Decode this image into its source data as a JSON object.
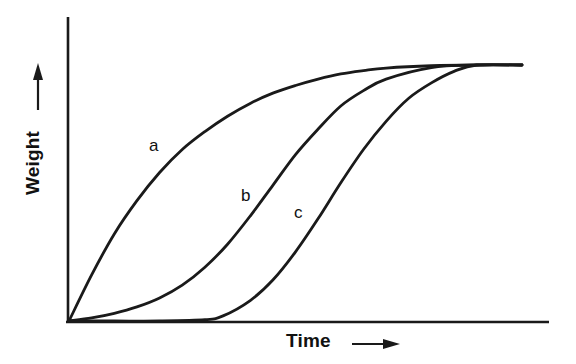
{
  "figure": {
    "background_color": "#ffffff",
    "line_color": "#1a1a1a",
    "axes": {
      "x_axis_label": "Time",
      "x_axis_arrow": "right-arrow-icon",
      "y_axis_label": "Weight",
      "y_axis_arrow": "up-arrow-icon",
      "x_tick_labels": [],
      "y_tick_labels": [],
      "grid": false
    },
    "curve_labels": {
      "a": "a",
      "b": "b",
      "c": "c"
    }
  },
  "chart_data": {
    "type": "line",
    "title": "",
    "subtitle": "",
    "xlabel": "Time",
    "ylabel": "Weight",
    "xlim": [
      0,
      1
    ],
    "ylim": [
      0,
      1
    ],
    "grid": false,
    "legend": "inline-curve-labels",
    "axis_style": "arrow-annotated, unlabeled ticks, schematic",
    "annotations": [
      {
        "text": "a",
        "x": 0.185,
        "y": 0.585
      },
      {
        "text": "b",
        "x": 0.375,
        "y": 0.41
      },
      {
        "text": "c",
        "x": 0.485,
        "y": 0.345
      }
    ],
    "series": [
      {
        "name": "a",
        "label": "a",
        "description": "Fast saturating growth: rises steeply from the origin and plateaus earliest",
        "x": [
          0.0,
          0.05,
          0.1,
          0.15,
          0.2,
          0.25,
          0.3,
          0.35,
          0.4,
          0.45,
          0.5,
          0.55,
          0.6,
          0.65,
          0.7,
          0.8,
          0.9,
          1.0
        ],
        "y": [
          0.0,
          0.18,
          0.34,
          0.47,
          0.58,
          0.67,
          0.74,
          0.8,
          0.85,
          0.89,
          0.92,
          0.945,
          0.965,
          0.978,
          0.988,
          0.997,
          1.0,
          1.0
        ]
      },
      {
        "name": "b",
        "label": "b",
        "description": "Sigmoid growth with short lag: slow start, steep middle, plateaus second",
        "x": [
          0.0,
          0.05,
          0.1,
          0.15,
          0.2,
          0.25,
          0.3,
          0.35,
          0.4,
          0.45,
          0.5,
          0.55,
          0.6,
          0.65,
          0.7,
          0.8,
          0.9,
          1.0
        ],
        "y": [
          0.0,
          0.012,
          0.03,
          0.055,
          0.09,
          0.14,
          0.21,
          0.3,
          0.41,
          0.53,
          0.65,
          0.75,
          0.84,
          0.9,
          0.945,
          0.99,
          1.0,
          1.0
        ]
      },
      {
        "name": "c",
        "label": "c",
        "description": "Sigmoid growth with long lag: remains at baseline until about one third of the time axis, then rises steeply and plateaus last",
        "x": [
          0.0,
          0.1,
          0.2,
          0.3,
          0.34,
          0.4,
          0.45,
          0.5,
          0.55,
          0.6,
          0.65,
          0.7,
          0.75,
          0.8,
          0.85,
          0.9,
          1.0
        ],
        "y": [
          0.0,
          0.0,
          0.0,
          0.005,
          0.02,
          0.08,
          0.16,
          0.27,
          0.4,
          0.54,
          0.67,
          0.78,
          0.87,
          0.93,
          0.975,
          1.0,
          1.0
        ]
      }
    ]
  }
}
